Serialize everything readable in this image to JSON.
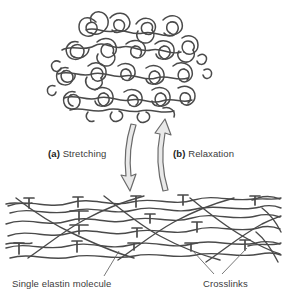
{
  "figure": {
    "width": 283,
    "height": 303,
    "background_color": "#ffffff",
    "stroke_color": "#4a4a4a",
    "text_color": "#3b3b3b"
  },
  "panels": {
    "top": {
      "name": "relaxed-coiled-elastin-network",
      "description": "Random coiled elastin molecules"
    },
    "bottom": {
      "name": "stretched-elastin-network",
      "description": "Extended elastin strands joined by crosslinks"
    }
  },
  "arrows": {
    "stretching": {
      "direction": "down",
      "icon": "curved-arrow-down-icon"
    },
    "relaxation": {
      "direction": "up",
      "icon": "curved-arrow-up-icon"
    }
  },
  "labels": {
    "stretching": {
      "prefix": "(a)",
      "text": " Stretching"
    },
    "relaxation": {
      "prefix": "(b)",
      "text": " Relaxation"
    },
    "single_elastin": "Single elastin molecule",
    "crosslinks": "Crosslinks"
  }
}
